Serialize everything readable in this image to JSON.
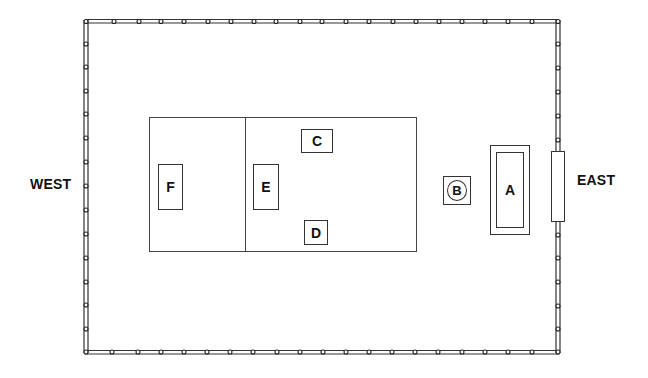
{
  "diagram": {
    "type": "floor-plan",
    "labels": {
      "west": "WEST",
      "east": "EAST"
    },
    "enclosure": {
      "description": "Fenced rectangular enclosure with posts",
      "left": 85,
      "top": 21,
      "right": 559,
      "bottom": 352
    },
    "court": {
      "description": "Rectangular area divided into two sections",
      "left": 149,
      "top": 117,
      "right": 417,
      "bottom": 252,
      "divider_x": 245
    },
    "items": [
      {
        "id": "A",
        "label": "A",
        "shape": "double-bordered-rectangle"
      },
      {
        "id": "B",
        "label": "B",
        "shape": "square-with-circle"
      },
      {
        "id": "C",
        "label": "C",
        "shape": "rectangle"
      },
      {
        "id": "D",
        "label": "D",
        "shape": "rectangle"
      },
      {
        "id": "E",
        "label": "E",
        "shape": "rectangle"
      },
      {
        "id": "F",
        "label": "F",
        "shape": "rectangle"
      }
    ],
    "gate": {
      "description": "Entrance gate on the east side"
    },
    "colors": {
      "line": "#333333",
      "background": "#ffffff",
      "text": "#111111"
    }
  }
}
